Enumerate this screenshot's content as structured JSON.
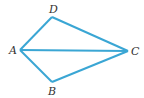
{
  "diagram": {
    "type": "quadrilateral-kite",
    "line_color": "#3aa6d4",
    "label_color": "#333333",
    "vertices": {
      "A": {
        "label": "A",
        "x": 20,
        "y": 50
      },
      "B": {
        "label": "B",
        "x": 52,
        "y": 82
      },
      "C": {
        "label": "C",
        "x": 128,
        "y": 51
      },
      "D": {
        "label": "D",
        "x": 52,
        "y": 17
      }
    },
    "segments": [
      "AD",
      "DC",
      "CB",
      "BA",
      "AC"
    ]
  }
}
